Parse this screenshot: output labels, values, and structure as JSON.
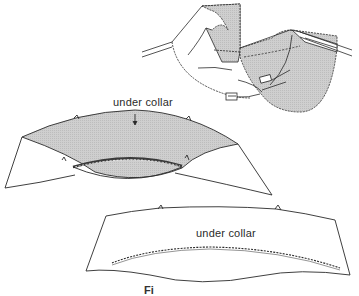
{
  "figure": {
    "labels": {
      "middle_piece": "under collar",
      "bottom_piece": "under collar"
    },
    "caption_fragment": "Fi",
    "colors": {
      "line": "#2a2a2a",
      "shade": "#c9c9c9",
      "background": "#ffffff"
    },
    "parts": [
      {
        "name": "garment-collar-attachment-view",
        "description": "top-right: collar being stitched to garment neckline"
      },
      {
        "name": "under-collar-shaded",
        "description": "middle: shaded under collar with stitched neckline seam"
      },
      {
        "name": "under-collar-flat",
        "description": "bottom: flat under collar with dashed stitching line"
      }
    ]
  }
}
